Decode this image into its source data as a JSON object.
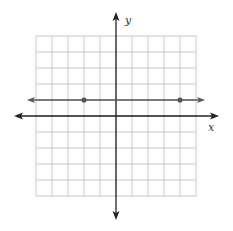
{
  "chart_data": {
    "type": "line",
    "title": "",
    "xlabel": "x",
    "ylabel": "y",
    "xlim": [
      -5,
      5
    ],
    "ylim": [
      -5,
      5
    ],
    "grid": true,
    "grid_step": 1,
    "series": [
      {
        "name": "horizontal line y = 1",
        "equation": "y = 1",
        "extends_both_directions": true,
        "points": [
          {
            "x": -2,
            "y": 1
          },
          {
            "x": 4,
            "y": 1
          }
        ]
      }
    ]
  },
  "labels": {
    "x_axis": "x",
    "y_axis": "y"
  },
  "colors": {
    "grid": "#c8c8c8",
    "axis": "#222222",
    "line": "#555555",
    "point": "#555555"
  }
}
